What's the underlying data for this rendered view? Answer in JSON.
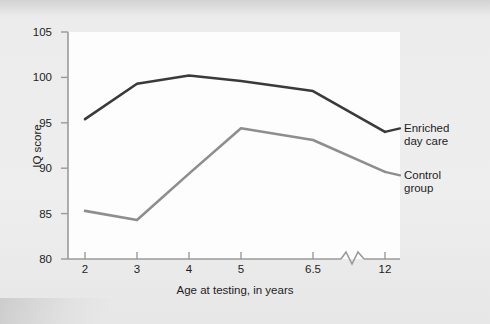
{
  "chart_data": {
    "type": "line",
    "title": "",
    "subtitle": "",
    "xlabel": "Age at testing, in years",
    "ylabel": "IQ score",
    "categories": [
      "2",
      "3",
      "4",
      "5",
      "6.5",
      "12"
    ],
    "x_tick_labels": [
      "2",
      "3",
      "4",
      "5",
      "6.5",
      "12"
    ],
    "y_tick_labels": [
      "80",
      "85",
      "90",
      "95",
      "100",
      "105"
    ],
    "ylim": [
      80,
      105
    ],
    "y_tick_values": [
      80,
      85,
      90,
      95,
      100,
      105
    ],
    "axis_break": {
      "present": true,
      "between": [
        "6.5",
        "12"
      ],
      "style": "zigzag"
    },
    "grid": false,
    "legend_position": "right-inline-labels",
    "series": [
      {
        "name": "Enriched day care",
        "label_line1": "Enriched",
        "label_line2": "day care",
        "color": "#3a3a3a",
        "values": [
          95.4,
          99.3,
          100.2,
          99.6,
          98.5,
          94.0
        ]
      },
      {
        "name": "Control group",
        "label_line1": "Control",
        "label_line2": "group",
        "color": "#8e8e8e",
        "values": [
          85.3,
          84.3,
          89.4,
          94.4,
          93.1,
          89.6
        ]
      }
    ]
  },
  "figure": {
    "background_color": "#ececec",
    "plot_background_color": "#fdfdfd",
    "axis_color": "#9a9a9a",
    "text_color": "#1d1d1d"
  }
}
